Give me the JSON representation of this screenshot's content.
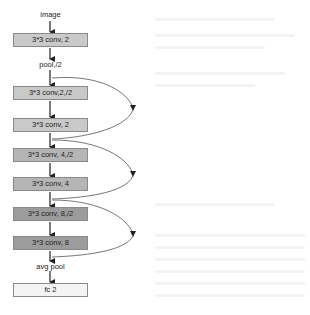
{
  "diagram": {
    "type": "network-architecture-flowchart",
    "input_label": "image",
    "nodes": [
      {
        "id": "conv1",
        "label": "3*3 conv, 2",
        "shade": "#c9c9c9"
      },
      {
        "id": "pool1",
        "label": "pool,/2",
        "kind": "text"
      },
      {
        "id": "conv2a",
        "label": "3*3 conv,2,/2",
        "shade": "#c9c9c9"
      },
      {
        "id": "conv2b",
        "label": "3*3 conv, 2",
        "shade": "#c9c9c9"
      },
      {
        "id": "conv3a",
        "label": "3*3 conv, 4,/2",
        "shade": "#b3b3b3"
      },
      {
        "id": "conv3b",
        "label": "3*3 conv, 4",
        "shade": "#b3b3b3"
      },
      {
        "id": "conv4a",
        "label": "3*3 conv, 8,/2",
        "shade": "#9a9a9a"
      },
      {
        "id": "conv4b",
        "label": "3*3 conv, 8",
        "shade": "#9a9a9a"
      },
      {
        "id": "avgpool",
        "label": "avg pool",
        "kind": "text"
      },
      {
        "id": "fc",
        "label": "fc 2",
        "shade": "#f4f4f4"
      }
    ],
    "skip_connections": [
      {
        "from": "pool1",
        "to": "conv2b-output"
      },
      {
        "from": "conv2b-output",
        "to": "conv3b-output"
      },
      {
        "from": "conv3b-output",
        "to": "conv4b-output"
      }
    ]
  }
}
